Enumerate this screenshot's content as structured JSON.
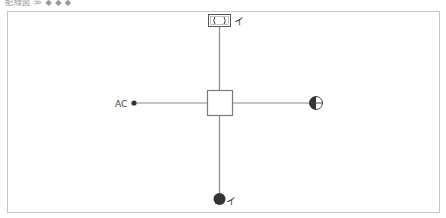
{
  "title": "配線図 ≫ ◆ ◆ ◆",
  "diagram": {
    "center_box": {
      "label": "",
      "x": 207,
      "y": 90,
      "w": 25,
      "h": 26
    },
    "colors": {
      "line": "#8a8a8a",
      "symbol": "#3a3a3a",
      "frame": "#c8c8c8"
    },
    "nodes": {
      "top": {
        "symbol": "outlet-box-icon",
        "glyph": "( )",
        "label": "イ"
      },
      "left": {
        "symbol": "terminal-dot-icon",
        "label": "AC"
      },
      "right": {
        "symbol": "half-filled-circle-icon",
        "label": ""
      },
      "bottom": {
        "symbol": "filled-circle-icon",
        "label": "イ"
      }
    }
  }
}
